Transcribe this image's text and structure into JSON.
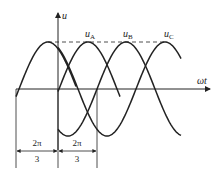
{
  "diagram": {
    "axes": {
      "y_label": "u",
      "x_label": "ωt"
    },
    "waveforms": [
      {
        "name": "u_A",
        "label_main": "u",
        "label_sub": "A",
        "phase_shift": "0"
      },
      {
        "name": "u_B",
        "label_main": "u",
        "label_sub": "B",
        "phase_shift": "2π/3"
      },
      {
        "name": "u_C",
        "label_main": "u",
        "label_sub": "C",
        "phase_shift": "4π/3"
      }
    ],
    "peak_reference": "dashed line at peak amplitude",
    "dimensions": [
      {
        "numerator": "2π",
        "denominator": "3"
      },
      {
        "numerator": "2π",
        "denominator": "3"
      }
    ]
  }
}
